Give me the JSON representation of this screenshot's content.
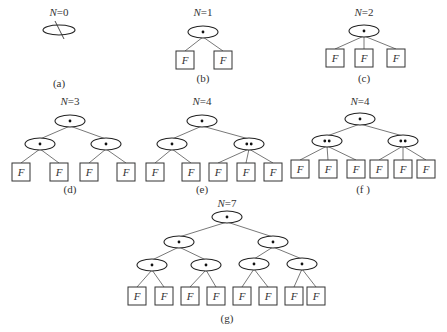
{
  "figure": {
    "colors": {
      "stroke": "#222222",
      "edge": "#555555",
      "text": "#333333",
      "background": "#ffffff"
    },
    "leaf_label": "F",
    "panels": [
      {
        "id": "a",
        "title_var": "N",
        "title_eq": "=0",
        "caption": "(a)",
        "title_pos": [
          59,
          16
        ],
        "caption_pos": [
          59,
          87
        ],
        "empty_root": {
          "x": 59,
          "y": 30
        },
        "nodes": [],
        "leaves": [],
        "edges": []
      },
      {
        "id": "b",
        "title_var": "N",
        "title_eq": "=1",
        "caption": "(b)",
        "title_pos": [
          203,
          16
        ],
        "caption_pos": [
          203,
          82
        ],
        "nodes": [
          {
            "x": 203,
            "y": 32,
            "dots": 1
          }
        ],
        "leaves": [
          {
            "x": 185,
            "y": 60
          },
          {
            "x": 223,
            "y": 60
          }
        ],
        "edges": [
          [
            0,
            0
          ],
          [
            0,
            1
          ]
        ]
      },
      {
        "id": "c",
        "title_var": "N",
        "title_eq": "=2",
        "caption": "(c)",
        "title_pos": [
          364,
          16
        ],
        "caption_pos": [
          364,
          82
        ],
        "nodes": [
          {
            "x": 364,
            "y": 31,
            "dots": 1
          }
        ],
        "leaves": [
          {
            "x": 335,
            "y": 58
          },
          {
            "x": 364,
            "y": 58
          },
          {
            "x": 396,
            "y": 58
          }
        ],
        "edges": [
          [
            0,
            0
          ],
          [
            0,
            1
          ],
          [
            0,
            2
          ]
        ]
      },
      {
        "id": "d",
        "title_var": "N",
        "title_eq": "=3",
        "caption": "(d)",
        "title_pos": [
          70,
          105
        ],
        "caption_pos": [
          70,
          193
        ],
        "nodes": [
          {
            "x": 70,
            "y": 121,
            "dots": 1
          },
          {
            "x": 40,
            "y": 144,
            "dots": 1
          },
          {
            "x": 106,
            "y": 144,
            "dots": 1
          }
        ],
        "node_edges": [
          [
            0,
            1
          ],
          [
            0,
            2
          ]
        ],
        "leaves": [
          {
            "x": 21,
            "y": 172
          },
          {
            "x": 59,
            "y": 172
          },
          {
            "x": 89,
            "y": 172
          },
          {
            "x": 126,
            "y": 172
          }
        ],
        "edges": [
          [
            1,
            0
          ],
          [
            1,
            1
          ],
          [
            2,
            2
          ],
          [
            2,
            3
          ]
        ]
      },
      {
        "id": "e",
        "title_var": "N",
        "title_eq": "=4",
        "caption": "(e)",
        "title_pos": [
          202,
          105
        ],
        "caption_pos": [
          202,
          193
        ],
        "nodes": [
          {
            "x": 202,
            "y": 121,
            "dots": 1
          },
          {
            "x": 172,
            "y": 144,
            "dots": 1
          },
          {
            "x": 249,
            "y": 144,
            "dots": 2
          }
        ],
        "node_edges": [
          [
            0,
            1
          ],
          [
            0,
            2
          ]
        ],
        "leaves": [
          {
            "x": 155,
            "y": 172
          },
          {
            "x": 191,
            "y": 172
          },
          {
            "x": 218,
            "y": 172
          },
          {
            "x": 246,
            "y": 172
          },
          {
            "x": 273,
            "y": 172
          }
        ],
        "edges": [
          [
            1,
            0
          ],
          [
            1,
            1
          ],
          [
            2,
            2
          ],
          [
            2,
            3
          ],
          [
            2,
            4
          ]
        ]
      },
      {
        "id": "f",
        "title_var": "N",
        "title_eq": "=4",
        "caption": "(f )",
        "title_pos": [
          360,
          105
        ],
        "caption_pos": [
          363,
          193
        ],
        "nodes": [
          {
            "x": 360,
            "y": 119,
            "dots": 1
          },
          {
            "x": 327,
            "y": 141,
            "dots": 2
          },
          {
            "x": 403,
            "y": 141,
            "dots": 2
          }
        ],
        "node_edges": [
          [
            0,
            1
          ],
          [
            0,
            2
          ]
        ],
        "leaves": [
          {
            "x": 300,
            "y": 169
          },
          {
            "x": 328,
            "y": 169
          },
          {
            "x": 356,
            "y": 169
          },
          {
            "x": 379,
            "y": 169
          },
          {
            "x": 403,
            "y": 169
          },
          {
            "x": 426,
            "y": 169
          }
        ],
        "edges": [
          [
            1,
            0
          ],
          [
            1,
            1
          ],
          [
            1,
            2
          ],
          [
            2,
            3
          ],
          [
            2,
            4
          ],
          [
            2,
            5
          ]
        ]
      },
      {
        "id": "g",
        "title_var": "N",
        "title_eq": "=7",
        "caption": "(g)",
        "title_pos": [
          227,
          207
        ],
        "caption_pos": [
          227,
          322
        ],
        "nodes": [
          {
            "x": 227,
            "y": 217,
            "dots": 1
          },
          {
            "x": 179,
            "y": 242,
            "dots": 1
          },
          {
            "x": 273,
            "y": 242,
            "dots": 1
          },
          {
            "x": 152,
            "y": 265,
            "dots": 1
          },
          {
            "x": 206,
            "y": 265,
            "dots": 1
          },
          {
            "x": 254,
            "y": 264,
            "dots": 1
          },
          {
            "x": 302,
            "y": 264,
            "dots": 1
          }
        ],
        "node_edges": [
          [
            0,
            1
          ],
          [
            0,
            2
          ],
          [
            1,
            3
          ],
          [
            1,
            4
          ],
          [
            2,
            5
          ],
          [
            2,
            6
          ]
        ],
        "leaves": [
          {
            "x": 137,
            "y": 296
          },
          {
            "x": 164,
            "y": 296
          },
          {
            "x": 190,
            "y": 296
          },
          {
            "x": 216,
            "y": 296
          },
          {
            "x": 242,
            "y": 296
          },
          {
            "x": 268,
            "y": 296
          },
          {
            "x": 294,
            "y": 296
          },
          {
            "x": 316,
            "y": 296
          }
        ],
        "edges": [
          [
            3,
            0
          ],
          [
            3,
            1
          ],
          [
            4,
            2
          ],
          [
            4,
            3
          ],
          [
            5,
            4
          ],
          [
            5,
            5
          ],
          [
            6,
            6
          ],
          [
            6,
            7
          ]
        ]
      }
    ]
  }
}
